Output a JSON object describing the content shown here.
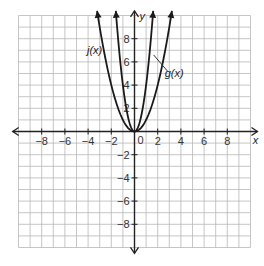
{
  "chart_data": {
    "type": "line",
    "title": "",
    "xlabel": "x",
    "ylabel": "y",
    "xlim": [
      -10,
      10
    ],
    "ylim": [
      -10,
      10
    ],
    "grid": true,
    "x_ticks": [
      -8,
      -6,
      -4,
      -2,
      2,
      4,
      6,
      8
    ],
    "y_ticks": [
      -8,
      -6,
      -4,
      -2,
      2,
      4,
      6,
      8
    ],
    "origin_label": "0",
    "series": [
      {
        "name": "j(x)",
        "expression": "x^2",
        "a": 1,
        "color": "#1a1a1a"
      },
      {
        "name": "g(x)",
        "expression": "4x^2",
        "a": 4,
        "color": "#1a1a1a"
      }
    ],
    "annotations": [
      {
        "text": "j(x)",
        "position": "left of wide parabola",
        "points_to": "j(x)"
      },
      {
        "text": "g(x)",
        "position": "right, with leader line",
        "points_to": "g(x)"
      }
    ]
  },
  "labels": {
    "x_axis": "x",
    "y_axis": "y",
    "origin": "0",
    "j": "j(x)",
    "g": "g(x)"
  }
}
